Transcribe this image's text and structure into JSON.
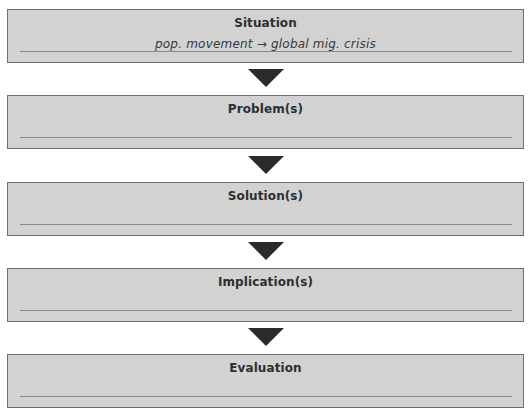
{
  "flowchart": {
    "steps": [
      {
        "title": "Situation",
        "note": "pop. movement → global mig. crisis"
      },
      {
        "title": "Problem(s)",
        "note": ""
      },
      {
        "title": "Solution(s)",
        "note": ""
      },
      {
        "title": "Implication(s)",
        "note": ""
      },
      {
        "title": "Evaluation",
        "note": ""
      }
    ],
    "connector_icon": "down-triangle-arrow",
    "colors": {
      "box_fill": "#d2d2d2",
      "box_border": "#6f6f6f",
      "arrow": "#2b2b2b",
      "title_text": "#2e2e2e"
    }
  }
}
